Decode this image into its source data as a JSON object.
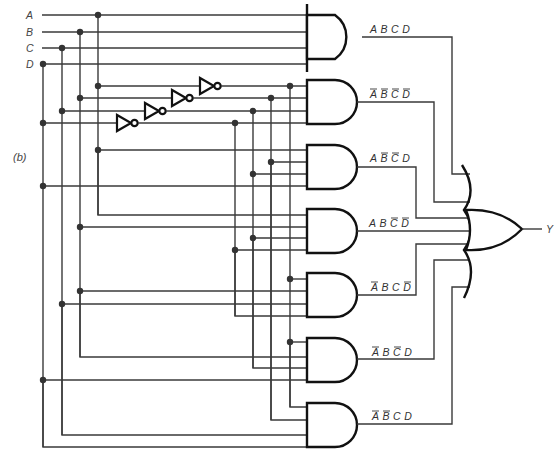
{
  "figure": {
    "panel_label": "(b)",
    "inputs": [
      {
        "name": "A",
        "y": 15
      },
      {
        "name": "B",
        "y": 32
      },
      {
        "name": "C",
        "y": 48
      },
      {
        "name": "D",
        "y": 64
      }
    ],
    "output": {
      "name": "Y"
    },
    "and_gates": [
      {
        "id": "g1",
        "term": "A B C D",
        "vars": [
          "A",
          "B",
          "C",
          "D"
        ],
        "inverted": [
          false,
          false,
          false,
          false
        ]
      },
      {
        "id": "g2",
        "term": "A' B' C' D'",
        "vars": [
          "A",
          "B",
          "C",
          "D"
        ],
        "inverted": [
          true,
          true,
          true,
          true
        ]
      },
      {
        "id": "g3",
        "term": "A B' C' D",
        "vars": [
          "A",
          "B",
          "C",
          "D"
        ],
        "inverted": [
          false,
          true,
          true,
          false
        ]
      },
      {
        "id": "g4",
        "term": "A B C' D'",
        "vars": [
          "A",
          "B",
          "C",
          "D"
        ],
        "inverted": [
          false,
          false,
          true,
          true
        ]
      },
      {
        "id": "g5",
        "term": "A' B C D'",
        "vars": [
          "A",
          "B",
          "C",
          "D"
        ],
        "inverted": [
          true,
          false,
          false,
          true
        ]
      },
      {
        "id": "g6",
        "term": "A' B C' D",
        "vars": [
          "A",
          "B",
          "C",
          "D"
        ],
        "inverted": [
          true,
          false,
          true,
          false
        ]
      },
      {
        "id": "g7",
        "term": "A' B' C D",
        "vars": [
          "A",
          "B",
          "C",
          "D"
        ],
        "inverted": [
          true,
          true,
          false,
          false
        ]
      }
    ],
    "or_gate": {
      "inputs": 7,
      "output": "Y"
    },
    "inverters": [
      {
        "input": "A",
        "output": "A'"
      },
      {
        "input": "B",
        "output": "B'"
      },
      {
        "input": "C",
        "output": "C'"
      },
      {
        "input": "D",
        "output": "D'"
      }
    ],
    "expression": "Y = ABCD + A'B'C'D' + AB'C'D + ABC'D' + A'BCD' + A'BC'D + A'B'CD"
  }
}
